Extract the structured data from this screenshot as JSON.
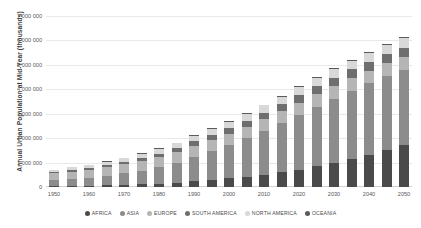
{
  "chart_data": {
    "type": "bar",
    "stacked": true,
    "title": "",
    "xlabel": "",
    "ylabel": "Annual Urban Population at Mid-Year (thousands)",
    "ylim": [
      0,
      7000000
    ],
    "ytick_step": 1000000,
    "ytick_labels": [
      "7 000 000",
      "6 000 000",
      "5 000 000",
      "4 000 000",
      "3 000 000",
      "2 000 000",
      "1 000 000",
      "0"
    ],
    "ytick_values": [
      7000000,
      6000000,
      5000000,
      4000000,
      3000000,
      2000000,
      1000000,
      0
    ],
    "grid": true,
    "legend_position": "bottom",
    "categories": [
      1950,
      1955,
      1960,
      1965,
      1970,
      1975,
      1980,
      1985,
      1990,
      1995,
      2000,
      2005,
      2010,
      2015,
      2020,
      2025,
      2030,
      2035,
      2040,
      2045,
      2050
    ],
    "xtick_labels": [
      "1950",
      "1960",
      "1970",
      "1980",
      "1990",
      "2000",
      "2010",
      "2020",
      "2030",
      "2040",
      "2050"
    ],
    "xtick_values": [
      1950,
      1960,
      1970,
      1980,
      1990,
      2000,
      2010,
      2020,
      2030,
      2040,
      2050
    ],
    "series": [
      {
        "name": "AFRICA",
        "color": "#4a4a4a",
        "values": [
          32800,
          41300,
          52300,
          66900,
          85800,
          110700,
          142400,
          183600,
          235000,
          290900,
          352500,
          424800,
          508000,
          604500,
          714400,
          840300,
          982800,
          1141500,
          1315400,
          1502500,
          1701500
        ]
      },
      {
        "name": "ASIA",
        "color": "#8c8c8c",
        "values": [
          244000,
          284500,
          334000,
          394500,
          468000,
          560000,
          673000,
          813500,
          1000000,
          1180000,
          1370000,
          1570000,
          1790000,
          2010000,
          2240000,
          2450000,
          2640000,
          2800000,
          2930000,
          3030000,
          3100000
        ]
      },
      {
        "name": "EUROPE",
        "color": "#b5b5b5",
        "values": [
          280000,
          300000,
          320000,
          345000,
          370000,
          392000,
          412000,
          430000,
          447000,
          455000,
          462000,
          470000,
          480000,
          492000,
          502000,
          510000,
          516000,
          521000,
          525000,
          528000,
          530000
        ]
      },
      {
        "name": "SOUTH AMERICA",
        "color": "#6e6e6e",
        "values": [
          42000,
          52000,
          64000,
          79000,
          97000,
          117000,
          139000,
          162000,
          186000,
          210000,
          232000,
          253000,
          273000,
          292000,
          310000,
          326000,
          340000,
          352000,
          362000,
          370000,
          376000
        ]
      },
      {
        "name": "NORTH AMERICA",
        "color": "#d8d8d8",
        "values": [
          110000,
          124000,
          139000,
          155000,
          171000,
          183000,
          196000,
          210000,
          224000,
          240000,
          256000,
          273000,
          290000,
          305000,
          320000,
          334000,
          347000,
          359000,
          370000,
          380000,
          389000
        ]
      },
      {
        "name": "OCEANIA",
        "color": "#5a5a5a",
        "values": [
          7700,
          8900,
          10300,
          11800,
          13300,
          14900,
          16500,
          18200,
          20000,
          21800,
          23700,
          25900,
          28300,
          30700,
          33200,
          35700,
          38200,
          40500,
          42700,
          44700,
          46600
        ]
      }
    ]
  },
  "legend": {
    "items": [
      {
        "label": "AFRICA"
      },
      {
        "label": "ASIA"
      },
      {
        "label": "EUROPE"
      },
      {
        "label": "SOUTH AMERICA"
      },
      {
        "label": "NORTH AMERICA"
      },
      {
        "label": "OCEANIA"
      }
    ]
  }
}
